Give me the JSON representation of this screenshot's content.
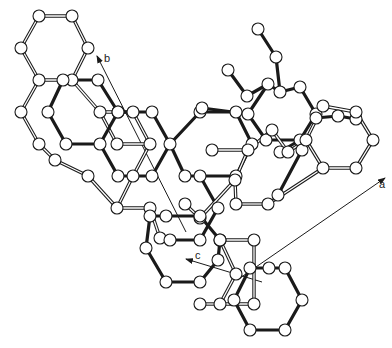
{
  "diagram": {
    "type": "crystal-structure-packing",
    "axes": [
      {
        "label": "a",
        "from": [
          240,
          278
        ],
        "to": [
          385,
          178
        ],
        "label_pos": [
          379,
          188
        ]
      },
      {
        "label": "b",
        "from": [
          186,
          232
        ],
        "to": [
          97,
          56
        ],
        "label_pos": [
          104,
          62
        ]
      },
      {
        "label": "c",
        "from": [
          262,
          282
        ],
        "to": [
          186,
          259
        ],
        "label_pos": [
          195,
          259
        ]
      }
    ],
    "colors": {
      "background": "#ffffff",
      "ink": "#1a1a1a",
      "atom_fill": "#ffffff"
    },
    "molecules": [
      {
        "name": "molecule-open-upper-left",
        "style": "open",
        "atoms": [
          [
            39,
            16
          ],
          [
            72,
            16
          ],
          [
            88,
            48
          ],
          [
            72,
            80
          ],
          [
            39,
            80
          ],
          [
            21,
            48
          ],
          [
            21,
            112
          ],
          [
            39,
            144
          ],
          [
            55,
            160
          ],
          [
            88,
            176
          ],
          [
            117,
            144
          ],
          [
            100,
            112
          ],
          [
            133,
            112
          ],
          [
            150,
            144
          ],
          [
            133,
            176
          ],
          [
            117,
            208
          ],
          [
            150,
            208
          ],
          [
            160,
            238
          ]
        ],
        "bonds": [
          [
            0,
            1
          ],
          [
            1,
            2
          ],
          [
            2,
            3
          ],
          [
            3,
            4
          ],
          [
            4,
            5
          ],
          [
            5,
            0
          ],
          [
            4,
            6
          ],
          [
            6,
            7
          ],
          [
            7,
            8
          ],
          [
            8,
            9
          ],
          [
            3,
            11
          ],
          [
            11,
            10
          ],
          [
            10,
            13
          ],
          [
            11,
            12
          ],
          [
            12,
            13
          ],
          [
            13,
            14
          ],
          [
            14,
            15
          ],
          [
            9,
            15
          ],
          [
            15,
            16
          ],
          [
            16,
            17
          ]
        ]
      },
      {
        "name": "molecule-bold-upper",
        "style": "bold",
        "atoms": [
          [
            63,
            80
          ],
          [
            98,
            80
          ],
          [
            118,
            112
          ],
          [
            100,
            144
          ],
          [
            66,
            144
          ],
          [
            48,
            112
          ],
          [
            118,
            112
          ],
          [
            152,
            112
          ],
          [
            170,
            144
          ],
          [
            152,
            176
          ],
          [
            118,
            176
          ],
          [
            185,
            176
          ],
          [
            200,
            112
          ],
          [
            236,
            112
          ],
          [
            252,
            144
          ],
          [
            236,
            176
          ],
          [
            200,
            176
          ],
          [
            218,
            208
          ],
          [
            200,
            240
          ],
          [
            170,
            240
          ]
        ],
        "bonds": [
          [
            0,
            1
          ],
          [
            1,
            2
          ],
          [
            2,
            3
          ],
          [
            3,
            4
          ],
          [
            4,
            5
          ],
          [
            5,
            0
          ],
          [
            2,
            7
          ],
          [
            7,
            8
          ],
          [
            8,
            9
          ],
          [
            9,
            10
          ],
          [
            10,
            3
          ],
          [
            8,
            11
          ],
          [
            11,
            16
          ],
          [
            16,
            15
          ],
          [
            15,
            14
          ],
          [
            14,
            13
          ],
          [
            13,
            12
          ],
          [
            12,
            8
          ],
          [
            16,
            17
          ],
          [
            17,
            18
          ],
          [
            18,
            19
          ]
        ]
      },
      {
        "name": "molecule-bold-right",
        "style": "bold",
        "atoms": [
          [
            258,
            29
          ],
          [
            276,
            57
          ],
          [
            228,
            70
          ],
          [
            247,
            96
          ],
          [
            268,
            84
          ],
          [
            280,
            92
          ],
          [
            300,
            87
          ],
          [
            316,
            114
          ],
          [
            300,
            140
          ],
          [
            266,
            140
          ],
          [
            248,
            114
          ],
          [
            202,
            108
          ],
          [
            280,
            152
          ],
          [
            316,
            118
          ],
          [
            338,
            116
          ],
          [
            356,
            119
          ],
          [
            302,
            150
          ],
          [
            278,
            195
          ]
        ],
        "bonds": [
          [
            0,
            1
          ],
          [
            1,
            5
          ],
          [
            2,
            3
          ],
          [
            3,
            4
          ],
          [
            4,
            5
          ],
          [
            5,
            6
          ],
          [
            6,
            7
          ],
          [
            7,
            8
          ],
          [
            8,
            9
          ],
          [
            9,
            10
          ],
          [
            10,
            4
          ],
          [
            10,
            11
          ],
          [
            8,
            12
          ],
          [
            7,
            13
          ],
          [
            13,
            14
          ],
          [
            14,
            15
          ],
          [
            8,
            16
          ],
          [
            16,
            17
          ]
        ]
      },
      {
        "name": "molecule-open-right",
        "style": "open",
        "atoms": [
          [
            323,
            106
          ],
          [
            356,
            112
          ],
          [
            373,
            140
          ],
          [
            356,
            168
          ],
          [
            323,
            168
          ],
          [
            306,
            140
          ],
          [
            272,
            130
          ],
          [
            288,
            152
          ],
          [
            248,
            150
          ],
          [
            235,
            180
          ],
          [
            200,
            218
          ],
          [
            212,
            150
          ],
          [
            185,
            204
          ],
          [
            268,
            204
          ],
          [
            236,
            204
          ]
        ],
        "bonds": [
          [
            0,
            1
          ],
          [
            1,
            2
          ],
          [
            2,
            3
          ],
          [
            3,
            4
          ],
          [
            4,
            5
          ],
          [
            5,
            0
          ],
          [
            5,
            7
          ],
          [
            7,
            6
          ],
          [
            6,
            8
          ],
          [
            8,
            9
          ],
          [
            4,
            13
          ],
          [
            13,
            14
          ],
          [
            14,
            9
          ],
          [
            9,
            10
          ],
          [
            10,
            12
          ],
          [
            8,
            11
          ]
        ]
      },
      {
        "name": "molecule-bold-lower-middle",
        "style": "bold",
        "atoms": [
          [
            150,
            216
          ],
          [
            166,
            216
          ],
          [
            200,
            216
          ],
          [
            220,
            240
          ],
          [
            200,
            282
          ],
          [
            166,
            282
          ],
          [
            146,
            248
          ],
          [
            218,
            260
          ]
        ],
        "bonds": [
          [
            0,
            1
          ],
          [
            1,
            2
          ],
          [
            2,
            3
          ],
          [
            3,
            7
          ],
          [
            7,
            4
          ],
          [
            4,
            5
          ],
          [
            5,
            6
          ],
          [
            6,
            0
          ]
        ]
      },
      {
        "name": "molecule-open-lower",
        "style": "open",
        "atoms": [
          [
            220,
            240
          ],
          [
            254,
            240
          ],
          [
            254,
            304
          ],
          [
            220,
            304
          ],
          [
            236,
            274
          ],
          [
            200,
            304
          ]
        ],
        "bonds": [
          [
            0,
            1
          ],
          [
            1,
            2
          ],
          [
            2,
            3
          ],
          [
            3,
            5
          ],
          [
            0,
            4
          ],
          [
            4,
            3
          ]
        ]
      },
      {
        "name": "molecule-bold-lower-right",
        "style": "bold",
        "atoms": [
          [
            250,
            268
          ],
          [
            285,
            268
          ],
          [
            302,
            300
          ],
          [
            285,
            330
          ],
          [
            250,
            330
          ],
          [
            234,
            300
          ],
          [
            269,
            268
          ]
        ],
        "bonds": [
          [
            0,
            6
          ],
          [
            6,
            1
          ],
          [
            1,
            2
          ],
          [
            2,
            3
          ],
          [
            3,
            4
          ],
          [
            4,
            5
          ],
          [
            5,
            0
          ]
        ]
      }
    ]
  }
}
